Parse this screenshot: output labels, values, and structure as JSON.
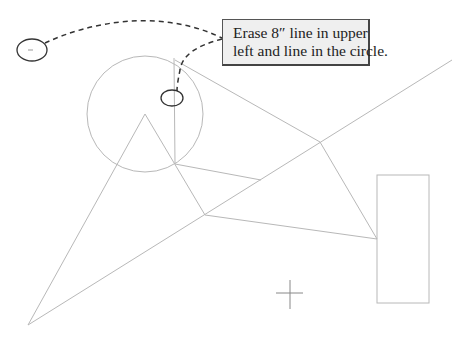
{
  "callout": {
    "line1": "Erase 8″ line in upper",
    "line2": "left and line in the circle."
  },
  "colors": {
    "geometry_line": "#b8b8b8",
    "annotation": "#333333",
    "callout_bg": "#efefef",
    "callout_border": "#555555"
  },
  "geometry": {
    "circle": {
      "cx": 145,
      "cy": 114,
      "r": 58
    },
    "rectangle": {
      "x": 377,
      "y": 175,
      "width": 52,
      "height": 128
    },
    "crosshair": {
      "x": 290,
      "y": 293,
      "arm": 14
    }
  },
  "annotations": {
    "ellipse_upper_left": {
      "cx": 32,
      "cy": 50,
      "rx": 15,
      "ry": 11
    },
    "ellipse_in_circle": {
      "cx": 172,
      "cy": 98,
      "rx": 11,
      "ry": 8
    }
  }
}
